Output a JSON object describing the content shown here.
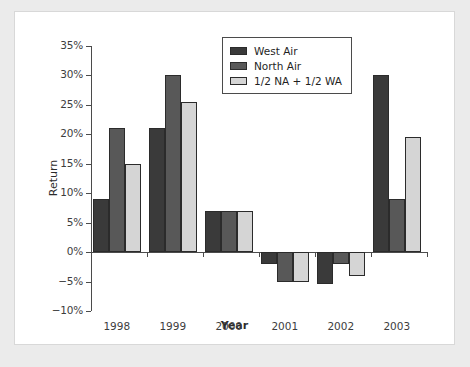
{
  "chart_data": {
    "type": "bar",
    "title": "",
    "xlabel": "Year",
    "ylabel": "Return",
    "categories": [
      "1998",
      "1999",
      "2000",
      "2001",
      "2002",
      "2003"
    ],
    "series": [
      {
        "name": "West Air",
        "color": "#3a3a3a",
        "values": [
          9,
          21,
          7,
          -2,
          -5.5,
          30
        ]
      },
      {
        "name": "North Air",
        "color": "#585858",
        "values": [
          21,
          30,
          7,
          -5,
          -2,
          9
        ]
      },
      {
        "name": "1/2 NA + 1/2 WA",
        "color": "#d5d5d5",
        "values": [
          15,
          25.5,
          7,
          -5,
          -4,
          19.5
        ]
      }
    ],
    "ylim": [
      -10,
      35
    ],
    "ytick_step": 5,
    "ytick_labels": [
      "35%",
      "30%",
      "25%",
      "20%",
      "15%",
      "10%",
      "5%",
      "0%",
      "−5%",
      "−10%"
    ],
    "ytick_values": [
      35,
      30,
      25,
      20,
      15,
      10,
      5,
      0,
      -5,
      -10
    ],
    "grid": false,
    "legend_position": "top-center",
    "zero_line": true,
    "value_suffix": "%"
  },
  "legend": {
    "items": [
      {
        "label": "West Air"
      },
      {
        "label": "North Air"
      },
      {
        "label": "1/2 NA + 1/2 WA"
      }
    ]
  },
  "axes": {
    "y_title": "Return",
    "x_title": "Year"
  }
}
